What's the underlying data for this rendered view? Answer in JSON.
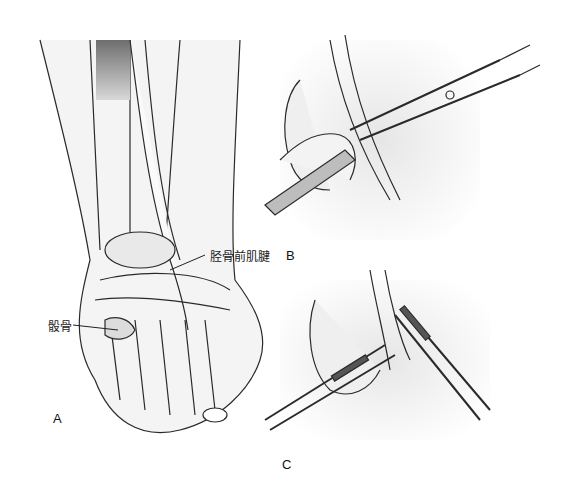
{
  "figure": {
    "panels": [
      {
        "id": "A",
        "letter": "A",
        "description": "Foot and ankle, anterior view with tibialis anterior tendon"
      },
      {
        "id": "B",
        "letter": "B",
        "description": "Tendon isolated with clamp and scalpel"
      },
      {
        "id": "C",
        "letter": "C",
        "description": "Tendon divided and held with two clamps"
      }
    ],
    "annotations": {
      "tendon": "胫骨前肌腱",
      "bone": "骰骨"
    },
    "colors": {
      "line": "#2a2a2a",
      "shade": "#bdbdbd",
      "muscle": "#8a8a8a",
      "background": "#ffffff"
    }
  }
}
